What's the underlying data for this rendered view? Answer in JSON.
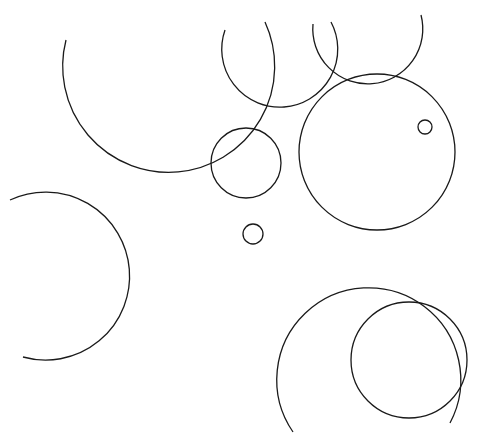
{
  "canvas": {
    "width": 477,
    "height": 441,
    "background": "#ffffff",
    "stroke": "#1a1a1a"
  },
  "top_text": "",
  "shapes": [
    {
      "id": "arc-top-left-large",
      "type": "arc",
      "cx": 168,
      "cy": 45,
      "r": 106,
      "from": [
        66,
        40
      ],
      "to": [
        265,
        22
      ],
      "sweep": 0,
      "large": 1
    },
    {
      "id": "arc-top-middle",
      "type": "arc",
      "cx": 280,
      "cy": 55,
      "r": 58,
      "from": [
        225,
        30
      ],
      "to": [
        331,
        22
      ],
      "sweep": 0,
      "large": 1
    },
    {
      "id": "arc-top-right",
      "type": "arc",
      "cx": 367,
      "cy": 43,
      "r": 55,
      "from": [
        313,
        24
      ],
      "to": [
        421,
        15
      ],
      "sweep": 0,
      "large": 1
    },
    {
      "id": "circle-right-large",
      "type": "circle",
      "cx": 377,
      "cy": 152,
      "r": 78
    },
    {
      "id": "circle-middle",
      "type": "circle",
      "cx": 246,
      "cy": 163,
      "r": 35
    },
    {
      "id": "circle-small-middle",
      "type": "circle",
      "cx": 253,
      "cy": 234,
      "r": 10
    },
    {
      "id": "circle-tiny-right",
      "type": "circle",
      "cx": 425,
      "cy": 127,
      "r": 7
    },
    {
      "id": "arc-left",
      "type": "arc",
      "cx": 42,
      "cy": 274,
      "r": 84,
      "from": [
        10,
        200
      ],
      "to": [
        23,
        357
      ],
      "sweep": 1,
      "large": 1
    },
    {
      "id": "arc-bottom-large",
      "type": "arc",
      "cx": 367,
      "cy": 375,
      "r": 92,
      "from": [
        293,
        432
      ],
      "to": [
        450,
        423
      ],
      "sweep": 1,
      "large": 1
    },
    {
      "id": "circle-bottom-right",
      "type": "circle",
      "cx": 409,
      "cy": 360,
      "r": 58
    }
  ]
}
